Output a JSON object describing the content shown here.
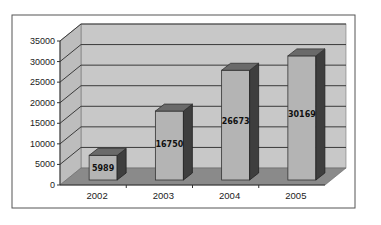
{
  "chart_data": {
    "type": "bar",
    "style": "3d-column",
    "title": "",
    "xlabel": "",
    "ylabel": "",
    "categories": [
      "2002",
      "2003",
      "2004",
      "2005"
    ],
    "values": [
      5989,
      16750,
      26673,
      30169
    ],
    "data_labels": [
      "5989",
      "16750",
      "26673",
      "30169"
    ],
    "ylim": [
      0,
      35000
    ],
    "yticks": [
      0,
      5000,
      10000,
      15000,
      20000,
      25000,
      30000,
      35000
    ],
    "ytick_labels": [
      "0",
      "5000",
      "10000",
      "15000",
      "20000",
      "25000",
      "30000",
      "35000"
    ],
    "grid": true,
    "legend": null
  },
  "colors": {
    "background": "#ffffff",
    "frame": "#555555",
    "back_wall": "#c8c8c8",
    "side_wall": "#bdbdbd",
    "floor": "#8a8a8a",
    "gridline": "#3a3a3a",
    "bar_front": "#b4b4b4",
    "bar_side": "#3e3e3e",
    "bar_top": "#6a6a6a"
  }
}
